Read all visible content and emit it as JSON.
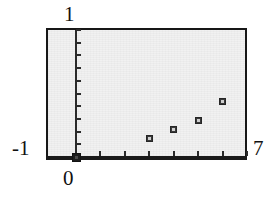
{
  "figure": {
    "kind": "scatter-plot",
    "background_color": "#ffffff",
    "plot_background_color": "#f0f0f0",
    "frame_color": "#171717",
    "point_color": "#3a3a3a"
  },
  "labels": {
    "y_max": "1",
    "y_min": "-1",
    "x_min": "0",
    "x_max": "7"
  },
  "chart_data": {
    "type": "scatter",
    "title": "",
    "xlabel": "",
    "ylabel": "",
    "xlim": [
      0,
      7
    ],
    "ylim": [
      -1,
      1
    ],
    "grid": false,
    "legend": null,
    "xticks": [
      0,
      1,
      2,
      3,
      4,
      5,
      6,
      7
    ],
    "xticklabels": [
      "0",
      "",
      "",
      "",
      "",
      "",
      "",
      "7"
    ],
    "yticks": [
      -1,
      -0.8,
      -0.6,
      -0.4,
      -0.2,
      0,
      0.2,
      0.4,
      0.6,
      0.8,
      1
    ],
    "yticklabels": [
      "-1",
      "",
      "",
      "",
      "",
      "",
      "",
      "",
      "",
      "",
      "1"
    ],
    "series": [
      {
        "name": "data",
        "marker": "square",
        "x": [
          0,
          3,
          4,
          5,
          6
        ],
        "y": [
          -1,
          -0.71,
          -0.56,
          -0.42,
          -0.13
        ]
      }
    ],
    "points": [
      {
        "x": 0,
        "y": -1,
        "px": 76,
        "py": 157
      },
      {
        "x": 3,
        "y": -0.71,
        "px": 141,
        "py": 142
      },
      {
        "x": 4,
        "y": -0.56,
        "px": 163,
        "py": 132
      },
      {
        "x": 5,
        "y": -0.42,
        "px": 188,
        "py": 121
      },
      {
        "x": 6,
        "y": -0.13,
        "px": 224,
        "py": 101
      }
    ]
  }
}
